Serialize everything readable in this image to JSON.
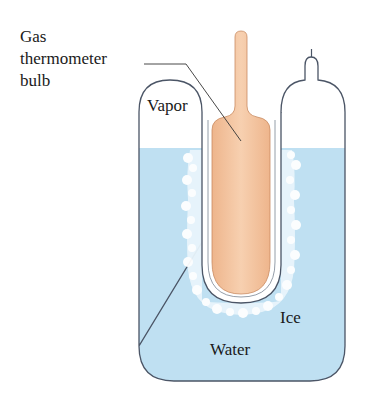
{
  "diagram": {
    "type": "constant-volume gas thermometer in triple-point cell",
    "labels": {
      "gas_bulb": [
        "Gas",
        "thermometer",
        "bulb"
      ],
      "vapor": "Vapor",
      "ice": "Ice",
      "water": "Water"
    },
    "colors": {
      "water": "#bfe0f2",
      "bulb": "#f4c7a2",
      "outline": "#4b5566",
      "ice": "#ffffff",
      "text": "#1a1a1a"
    }
  }
}
